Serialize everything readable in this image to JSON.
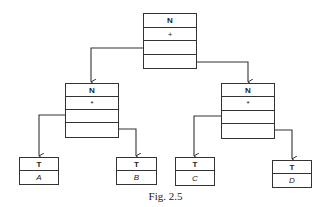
{
  "diagram": {
    "caption": "Fig. 2.5",
    "root": {
      "tag": "N",
      "op": "+"
    },
    "left": {
      "tag": "N",
      "op": "*"
    },
    "right": {
      "tag": "N",
      "op": "*"
    },
    "leaves": [
      {
        "tag": "T",
        "value": "A"
      },
      {
        "tag": "T",
        "value": "B"
      },
      {
        "tag": "T",
        "value": "C"
      },
      {
        "tag": "T",
        "value": "D"
      }
    ],
    "colors": {
      "line": "#333333",
      "background": "#ffffff"
    }
  }
}
